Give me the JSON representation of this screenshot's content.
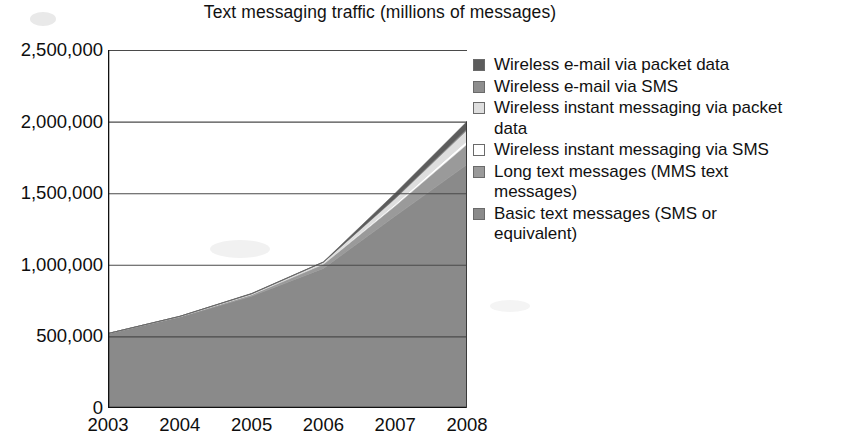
{
  "chart_data": {
    "type": "area",
    "title": "Text messaging traffic (millions of messages)",
    "xlabel": "",
    "ylabel": "",
    "stacked": true,
    "grid": true,
    "legend_position": "right",
    "categories": [
      "2003",
      "2004",
      "2005",
      "2006",
      "2007",
      "2008"
    ],
    "x": [
      2003,
      2004,
      2005,
      2006,
      2007,
      2008
    ],
    "ylim": [
      0,
      2500000
    ],
    "ytick_labels": [
      "0",
      "500,000",
      "1,000,000",
      "1,500,000",
      "2,000,000",
      "2,500,000"
    ],
    "ytick_values": [
      0,
      500000,
      1000000,
      1500000,
      2000000,
      2500000
    ],
    "stack_totals": [
      520000,
      640000,
      800000,
      1020000,
      1500000,
      2000000
    ],
    "series": [
      {
        "name": "Basic text messages (SMS or equivalent)",
        "color": "#8a8a8a",
        "values": [
          520000,
          635000,
          780000,
          975000,
          1340000,
          1700000
        ]
      },
      {
        "name": "Long text messages (MMS text messages)",
        "color": "#9a9a9a",
        "values": [
          0,
          3000,
          10000,
          28000,
          70000,
          140000
        ]
      },
      {
        "name": "Wireless instant messaging via SMS",
        "color": "#ffffff",
        "values": [
          0,
          1000,
          3000,
          6000,
          14000,
          26000
        ]
      },
      {
        "name": "Wireless instant messaging via packet data",
        "color": "#dedede",
        "values": [
          0,
          1000,
          4000,
          9000,
          38000,
          74000
        ]
      },
      {
        "name": "Wireless e-mail via SMS",
        "color": "#8e8e8e",
        "values": [
          0,
          0,
          1000,
          1000,
          5000,
          10000
        ]
      },
      {
        "name": "Wireless e-mail via packet data",
        "color": "#5c5c5c",
        "values": [
          0,
          0,
          2000,
          1000,
          33000,
          50000
        ]
      }
    ]
  },
  "legend": {
    "items": [
      {
        "label": "Wireless e-mail via packet data",
        "color": "#5c5c5c"
      },
      {
        "label": "Wireless e-mail via SMS",
        "color": "#8e8e8e"
      },
      {
        "label": "Wireless instant messaging via packet data",
        "color": "#dedede"
      },
      {
        "label": "Wireless instant messaging via SMS",
        "color": "#ffffff"
      },
      {
        "label": "Long text messages (MMS text messages)",
        "color": "#9a9a9a"
      },
      {
        "label": "Basic text messages (SMS or equivalent)",
        "color": "#8a8a8a"
      }
    ]
  }
}
